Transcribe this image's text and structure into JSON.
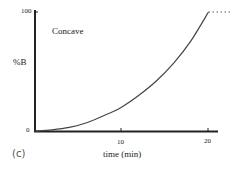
{
  "chart_data": {
    "type": "line",
    "title": "",
    "panel_label": "(c)",
    "annotation": "Concave",
    "xlabel": "time (min)",
    "ylabel": "%B",
    "xlim": [
      0,
      21
    ],
    "ylim": [
      0,
      100
    ],
    "x_ticks": [
      "10",
      "20"
    ],
    "y_ticks": [
      "0",
      "100"
    ],
    "grid": false,
    "legend": null,
    "series": [
      {
        "name": "Concave gradient",
        "x": [
          0,
          2,
          4,
          6,
          8,
          10,
          12,
          14,
          16,
          18,
          20
        ],
        "values": [
          0,
          1,
          3,
          7,
          13,
          20,
          30,
          42,
          57,
          76,
          100
        ],
        "style": "solid"
      },
      {
        "name": "Hold at 100%",
        "x": [
          20,
          22.5
        ],
        "values": [
          100,
          100
        ],
        "style": "dotted"
      }
    ]
  }
}
